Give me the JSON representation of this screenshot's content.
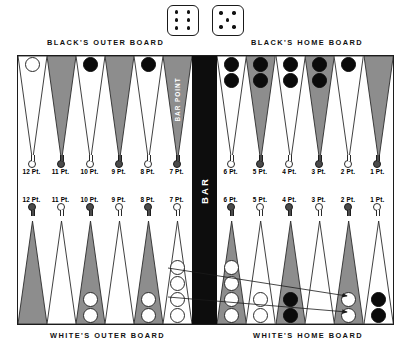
{
  "dice": {
    "name": "dice-roll",
    "values": [
      6,
      5
    ]
  },
  "captions": {
    "black_outer": "BLACK'S OUTER BOARD",
    "black_home": "BLACK'S HOME BOARD",
    "white_outer": "WHITE'S OUTER BOARD",
    "white_home": "WHITE'S HOME BOARD"
  },
  "bar": {
    "label": "BAR",
    "bar_point_label": "BAR POINT"
  },
  "colors": {
    "board_background": "#ffffff",
    "board_border": "#1c1c1c",
    "bar_fill": "#0d0d0d",
    "point_shaded": "#8d8d8d",
    "point_light": "#ffffff",
    "checker_black": "#0b0b0b",
    "checker_white": "#ffffff"
  },
  "board": {
    "top_left_quadrant": {
      "name": "blacks-outer-board",
      "points": [
        {
          "number": 12,
          "label": "12 Pt.",
          "shade": "light",
          "marker": "light",
          "checkers": {
            "color": "white",
            "count": 1
          }
        },
        {
          "number": 11,
          "label": "11 Pt.",
          "shade": "shaded",
          "marker": "dark",
          "checkers": {
            "color": "none",
            "count": 0
          }
        },
        {
          "number": 10,
          "label": "10 Pt.",
          "shade": "light",
          "marker": "light",
          "checkers": {
            "color": "black",
            "count": 1
          }
        },
        {
          "number": 9,
          "label": "9 Pt.",
          "shade": "shaded",
          "marker": "dark",
          "checkers": {
            "color": "none",
            "count": 0
          }
        },
        {
          "number": 8,
          "label": "8 Pt.",
          "shade": "light",
          "marker": "light",
          "checkers": {
            "color": "black",
            "count": 1
          }
        },
        {
          "number": 7,
          "label": "7 Pt.",
          "shade": "shaded",
          "marker": "dark",
          "checkers": {
            "color": "none",
            "count": 0
          },
          "caption": "BAR POINT"
        }
      ]
    },
    "top_right_quadrant": {
      "name": "blacks-home-board",
      "points": [
        {
          "number": 6,
          "label": "6 Pt.",
          "shade": "light",
          "marker": "light",
          "checkers": {
            "color": "black",
            "count": 2
          }
        },
        {
          "number": 5,
          "label": "5 Pt.",
          "shade": "shaded",
          "marker": "dark",
          "checkers": {
            "color": "black",
            "count": 2
          }
        },
        {
          "number": 4,
          "label": "4 Pt.",
          "shade": "light",
          "marker": "light",
          "checkers": {
            "color": "black",
            "count": 2
          }
        },
        {
          "number": 3,
          "label": "3 Pt.",
          "shade": "shaded",
          "marker": "dark",
          "checkers": {
            "color": "black",
            "count": 2
          }
        },
        {
          "number": 2,
          "label": "2 Pt.",
          "shade": "light",
          "marker": "light",
          "checkers": {
            "color": "black",
            "count": 1
          }
        },
        {
          "number": 1,
          "label": "1 Pt.",
          "shade": "shaded",
          "marker": "dark",
          "checkers": {
            "color": "none",
            "count": 0
          }
        }
      ]
    },
    "bottom_left_quadrant": {
      "name": "whites-outer-board",
      "points": [
        {
          "number": 12,
          "label": "12 Pt.",
          "shade": "shaded",
          "marker": "dark",
          "checkers": {
            "color": "none",
            "count": 0
          }
        },
        {
          "number": 11,
          "label": "11 Pt.",
          "shade": "light",
          "marker": "light",
          "checkers": {
            "color": "none",
            "count": 0
          }
        },
        {
          "number": 10,
          "label": "10 Pt.",
          "shade": "shaded",
          "marker": "dark",
          "checkers": {
            "color": "white",
            "count": 2
          }
        },
        {
          "number": 9,
          "label": "9 Pt.",
          "shade": "light",
          "marker": "light",
          "checkers": {
            "color": "none",
            "count": 0
          }
        },
        {
          "number": 8,
          "label": "8 Pt.",
          "shade": "shaded",
          "marker": "dark",
          "checkers": {
            "color": "white",
            "count": 2
          }
        },
        {
          "number": 7,
          "label": "7 Pt.",
          "shade": "light",
          "marker": "light",
          "checkers": {
            "color": "white",
            "count": 4
          }
        }
      ]
    },
    "bottom_right_quadrant": {
      "name": "whites-home-board",
      "points": [
        {
          "number": 6,
          "label": "6 Pt.",
          "shade": "shaded",
          "marker": "dark",
          "checkers": {
            "color": "white",
            "count": 4
          }
        },
        {
          "number": 5,
          "label": "5 Pt.",
          "shade": "light",
          "marker": "light",
          "checkers": {
            "color": "white",
            "count": 2
          }
        },
        {
          "number": 4,
          "label": "4 Pt.",
          "shade": "shaded",
          "marker": "dark",
          "checkers": {
            "color": "black",
            "count": 2
          }
        },
        {
          "number": 3,
          "label": "3 Pt.",
          "shade": "light",
          "marker": "light",
          "checkers": {
            "color": "none",
            "count": 0
          }
        },
        {
          "number": 2,
          "label": "2 Pt.",
          "shade": "shaded",
          "marker": "dark",
          "checkers": {
            "color": "white",
            "count": 2
          }
        },
        {
          "number": 1,
          "label": "1 Pt.",
          "shade": "light",
          "marker": "light",
          "checkers": {
            "color": "black",
            "count": 2
          }
        }
      ]
    }
  },
  "move_arrows": [
    {
      "name": "move-arrow-upper",
      "from_point": 7,
      "to_point": 2,
      "x1": 168,
      "y1": 268,
      "x2": 347,
      "y2": 296
    },
    {
      "name": "move-arrow-lower",
      "from_point": 7,
      "to_point": 2,
      "x1": 168,
      "y1": 297,
      "x2": 347,
      "y2": 312
    }
  ]
}
